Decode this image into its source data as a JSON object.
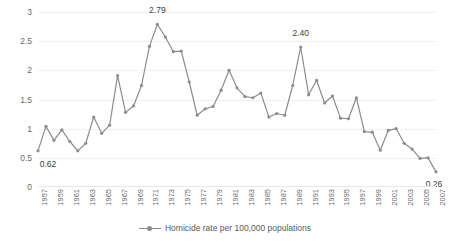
{
  "chart_data": {
    "type": "line",
    "title": "",
    "subtitle": "",
    "xlabel": "",
    "ylabel": "",
    "ylim": [
      0,
      3
    ],
    "yticks": [
      0,
      0.5,
      1,
      1.5,
      2,
      2.5,
      3
    ],
    "ytick_labels": [
      "0",
      "0.5",
      "1",
      "1.5",
      "2",
      "2.5",
      "3"
    ],
    "grid": true,
    "grid_axis": "y",
    "legend_position": "bottom",
    "legend_entries": [
      "Homicide rate per 100,000 populations"
    ],
    "series_name": "Homicide rate per 100,000 populations",
    "line_color": "#8c8c8c",
    "marker": "circle",
    "x": [
      1957,
      1958,
      1959,
      1960,
      1961,
      1962,
      1963,
      1964,
      1965,
      1966,
      1967,
      1968,
      1969,
      1970,
      1971,
      1972,
      1973,
      1974,
      1975,
      1976,
      1977,
      1978,
      1979,
      1980,
      1981,
      1982,
      1983,
      1984,
      1985,
      1986,
      1987,
      1988,
      1989,
      1990,
      1991,
      1992,
      1993,
      1994,
      1995,
      1996,
      1997,
      1998,
      1999,
      2000,
      2001,
      2002,
      2003,
      2004,
      2005,
      2006,
      2007
    ],
    "values": [
      0.62,
      1.04,
      0.8,
      0.98,
      0.78,
      0.62,
      0.75,
      1.2,
      0.92,
      1.06,
      1.91,
      1.28,
      1.39,
      1.74,
      2.41,
      2.79,
      2.57,
      2.32,
      2.33,
      1.8,
      1.23,
      1.34,
      1.38,
      1.66,
      2.0,
      1.7,
      1.55,
      1.53,
      1.61,
      1.2,
      1.26,
      1.23,
      1.74,
      2.4,
      1.58,
      1.83,
      1.44,
      1.56,
      1.18,
      1.17,
      1.53,
      0.95,
      0.94,
      0.63,
      0.97,
      1.0,
      0.75,
      0.65,
      0.49,
      0.5,
      0.26
    ],
    "xtick_labels": [
      "1957",
      "1959",
      "1961",
      "1963",
      "1965",
      "1967",
      "1969",
      "1971",
      "1973",
      "1975",
      "1977",
      "1979",
      "1981",
      "1983",
      "1985",
      "1987",
      "1989",
      "1991",
      "1993",
      "1995",
      "1997",
      "1999",
      "2001",
      "2003",
      "2005",
      "2007"
    ],
    "xtick_indices": [
      0,
      2,
      4,
      6,
      8,
      10,
      12,
      14,
      16,
      18,
      20,
      22,
      24,
      26,
      28,
      30,
      32,
      34,
      36,
      38,
      40,
      42,
      44,
      46,
      48,
      50
    ],
    "annotations": [
      {
        "index": 0,
        "text": "0.62",
        "dx": 10,
        "dy": 14
      },
      {
        "index": 15,
        "text": "2.79",
        "dx": 0,
        "dy": -13
      },
      {
        "index": 33,
        "text": "2.40",
        "dx": 0,
        "dy": -13
      },
      {
        "index": 50,
        "text": "0.26",
        "dx": -2,
        "dy": 13
      }
    ]
  },
  "legend": {
    "label": "Homicide rate per 100,000 populations"
  }
}
